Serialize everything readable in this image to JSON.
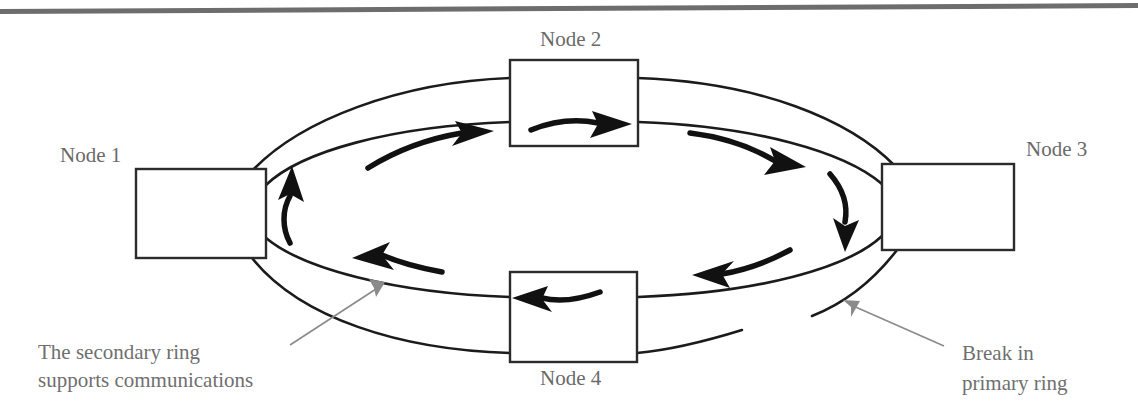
{
  "figure": {
    "top_rule": true,
    "background": "#ffffff",
    "ink_color": "#1b1b1b",
    "label_color": "#6a6a6a",
    "leader_color": "#8a8a8a"
  },
  "nodes": [
    {
      "id": "node-1",
      "label": "Node 1",
      "label_position": "above-left",
      "x": 136,
      "y": 169,
      "w": 130,
      "h": 89,
      "inner_arrow": null
    },
    {
      "id": "node-2",
      "label": "Node 2",
      "label_position": "above",
      "x": 510,
      "y": 60,
      "w": 128,
      "h": 86,
      "inner_arrow": "right"
    },
    {
      "id": "node-3",
      "label": "Node 3",
      "label_position": "above-right",
      "x": 882,
      "y": 164,
      "w": 132,
      "h": 86,
      "inner_arrow": null
    },
    {
      "id": "node-4",
      "label": "Node 4",
      "label_position": "below",
      "x": 510,
      "y": 272,
      "w": 127,
      "h": 90,
      "inner_arrow": "left"
    }
  ],
  "rings": [
    {
      "id": "primary-ring",
      "name": "primary ring",
      "broken": true,
      "break_location": "bottom-right"
    },
    {
      "id": "secondary-ring",
      "name": "secondary ring",
      "broken": false,
      "break_location": null
    }
  ],
  "flow_arrows": [
    {
      "id": "flow-top-left",
      "direction": "right",
      "segment": "inner-ring-top-left"
    },
    {
      "id": "flow-top-right",
      "direction": "right",
      "segment": "inner-ring-top-right"
    },
    {
      "id": "flow-right-down",
      "direction": "down",
      "segment": "inner-ring-right"
    },
    {
      "id": "flow-bottom-right",
      "direction": "left",
      "segment": "inner-ring-bottom-right"
    },
    {
      "id": "flow-bottom-left",
      "direction": "left",
      "segment": "inner-ring-bottom-left"
    },
    {
      "id": "flow-left-up",
      "direction": "up",
      "segment": "inner-ring-left"
    }
  ],
  "annotations": {
    "secondary": {
      "id": "secondary-ring-annotation",
      "line1": "The secondary ring",
      "line2": "supports communications",
      "leader": "points up-right to the secondary ring"
    },
    "break": {
      "id": "break-annotation",
      "line1": "Break in",
      "line2": "primary ring",
      "leader": "points up-left to the gap in the primary ring"
    }
  }
}
